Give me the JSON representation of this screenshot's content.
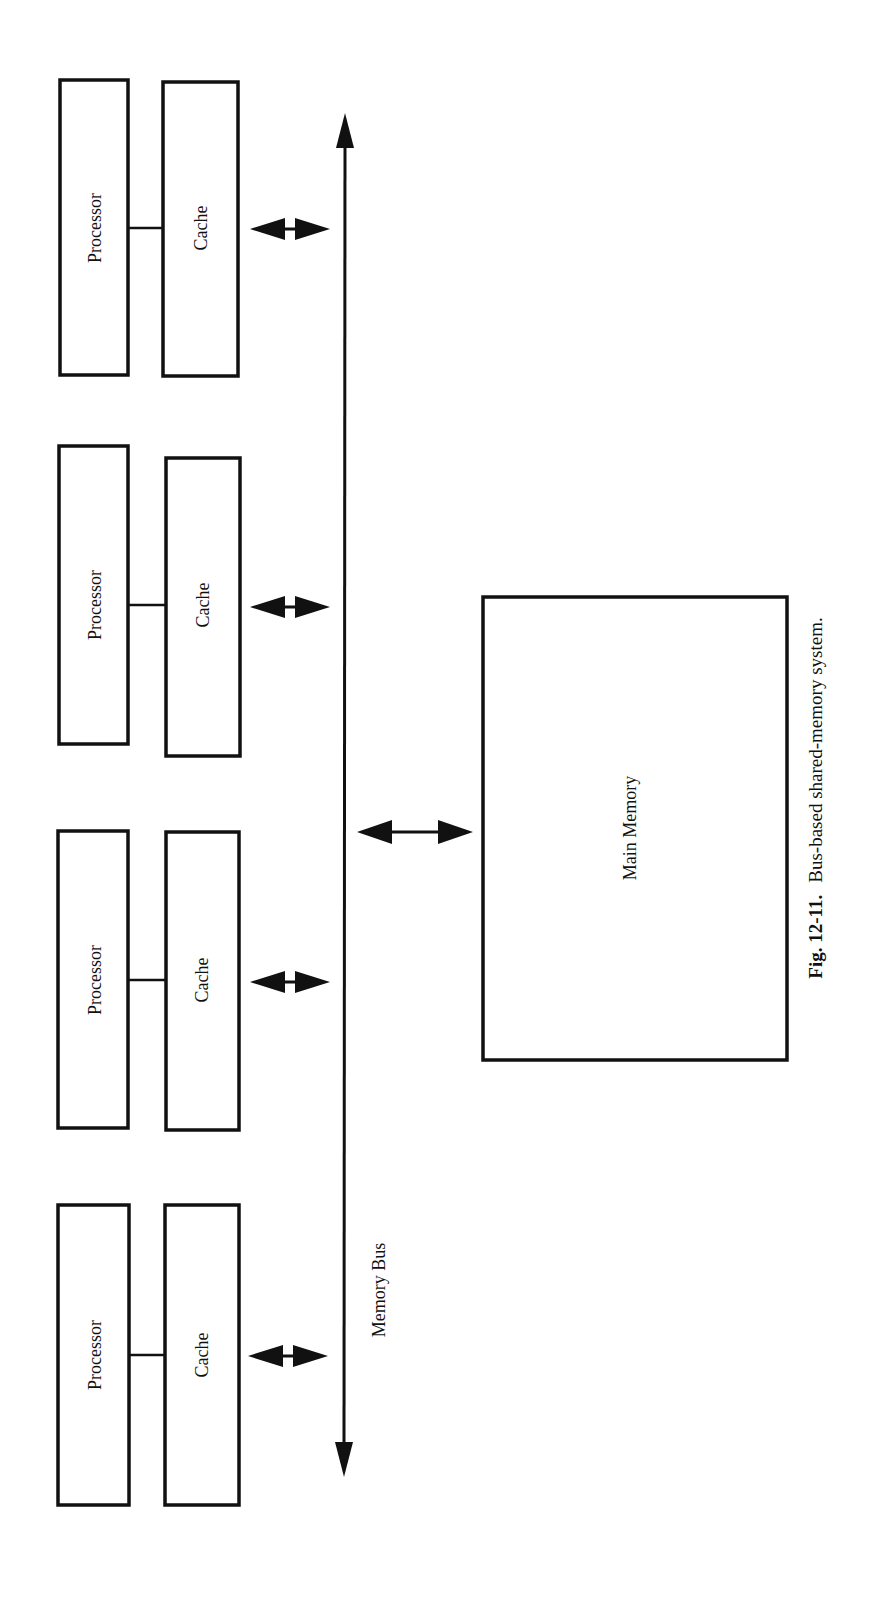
{
  "figure": {
    "caption_number": "Fig. 12-11.",
    "caption_text": "Bus-based shared-memory system.",
    "orientation": "rotated 90° counter-clockwise"
  },
  "nodes": {
    "processor_nodes": [
      {
        "processor_label": "Processor",
        "cache_label": "Cache"
      },
      {
        "processor_label": "Processor",
        "cache_label": "Cache"
      },
      {
        "processor_label": "Processor",
        "cache_label": "Cache"
      },
      {
        "processor_label": "Processor",
        "cache_label": "Cache"
      }
    ],
    "bus_label": "Memory Bus",
    "memory_label": "Main Memory"
  },
  "edges": [
    {
      "from": "processor-1",
      "to": "cache-1",
      "type": "line"
    },
    {
      "from": "processor-2",
      "to": "cache-2",
      "type": "line"
    },
    {
      "from": "processor-3",
      "to": "cache-3",
      "type": "line"
    },
    {
      "from": "processor-4",
      "to": "cache-4",
      "type": "line"
    },
    {
      "from": "cache-1",
      "to": "memory-bus",
      "type": "bidirectional-arrow"
    },
    {
      "from": "cache-2",
      "to": "memory-bus",
      "type": "bidirectional-arrow"
    },
    {
      "from": "cache-3",
      "to": "memory-bus",
      "type": "bidirectional-arrow"
    },
    {
      "from": "cache-4",
      "to": "memory-bus",
      "type": "bidirectional-arrow"
    },
    {
      "from": "memory-bus",
      "to": "main-memory",
      "type": "bidirectional-arrow"
    }
  ]
}
